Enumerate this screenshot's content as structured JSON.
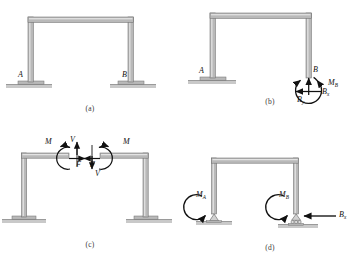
{
  "figure": {
    "colors": {
      "member_fill": "#b9b9b9",
      "member_edge": "#6e6e6e",
      "member_highlight": "#e4e4e4",
      "ground": "#c9c9c9",
      "ground_edge": "#9a9a9a",
      "ink": "#111111",
      "caption": "#3a3a3a",
      "background": "#ffffff"
    },
    "panels": [
      {
        "id": "a",
        "caption": "(a)",
        "description": "Fixed-fixed portal frame with supports A and B",
        "labels": [
          {
            "name": "support-label-a",
            "text": "A",
            "sub": "",
            "x": 18,
            "y": 71
          },
          {
            "name": "support-label-b",
            "text": "B",
            "sub": "",
            "x": 122,
            "y": 71
          }
        ]
      },
      {
        "id": "b",
        "caption": "(b)",
        "description": "Frame released at B showing reaction components",
        "labels": [
          {
            "name": "support-label-a",
            "text": "A",
            "sub": "",
            "x": 19,
            "y": 67
          },
          {
            "name": "joint-label-b",
            "text": "B",
            "sub": "",
            "x": 133,
            "y": 66
          },
          {
            "name": "moment-label-mb",
            "text": "M",
            "sub": "B",
            "x": 148,
            "y": 79
          },
          {
            "name": "force-label-bx",
            "text": "B",
            "sub": "x",
            "x": 142,
            "y": 96
          },
          {
            "name": "force-label-by",
            "text": "B",
            "sub": "y",
            "x": 117,
            "y": 104
          }
        ]
      },
      {
        "id": "c",
        "caption": "(c)",
        "description": "Frame cut at midspan of the girder showing internal M, V and F",
        "labels": [
          {
            "name": "moment-label-m-left",
            "text": "M",
            "sub": "",
            "x": 45,
            "y": 5
          },
          {
            "name": "shear-label-v-left",
            "text": "V",
            "sub": "",
            "x": 70,
            "y": 3
          },
          {
            "name": "axial-label-f-left",
            "text": "F",
            "sub": "",
            "x": 76,
            "y": 28
          },
          {
            "name": "axial-label-f-right",
            "text": "F",
            "sub": "",
            "x": 90,
            "y": 28
          },
          {
            "name": "shear-label-v-right",
            "text": "V",
            "sub": "",
            "x": 95,
            "y": 37
          },
          {
            "name": "moment-label-m-right",
            "text": "M",
            "sub": "",
            "x": 123,
            "y": 5
          }
        ]
      },
      {
        "id": "d",
        "caption": "(d)",
        "description": "Frame on pin and roller supports with applied end moments and horizontal force",
        "labels": [
          {
            "name": "moment-label-ma",
            "text": "M",
            "sub": "A",
            "x": 16,
            "y": 58
          },
          {
            "name": "moment-label-mb",
            "text": "M",
            "sub": "B",
            "x": 110,
            "y": 58
          },
          {
            "name": "force-label-bx",
            "text": "B",
            "sub": "x",
            "x": 157,
            "y": 86
          }
        ]
      }
    ]
  }
}
